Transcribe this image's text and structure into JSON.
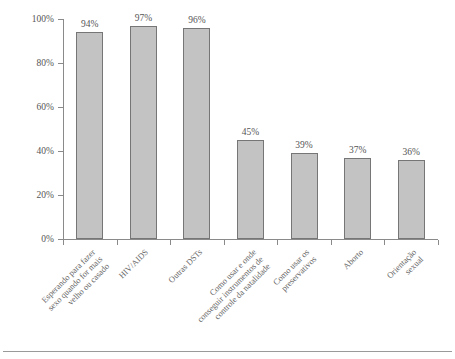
{
  "chart_data": {
    "type": "bar",
    "title": "",
    "subtitle": "",
    "xlabel": "",
    "ylabel": "",
    "ylim": [
      0,
      100
    ],
    "yticks": [
      "0%",
      "20%",
      "40%",
      "60%",
      "80%",
      "100%"
    ],
    "ytick_values": [
      0,
      20,
      40,
      60,
      80,
      100
    ],
    "grid": false,
    "legend": false,
    "legend_position": "none",
    "orientation": "vertical",
    "bar_color": "#c3c3c3",
    "bar_border_color": "#767676",
    "axis_color": "#8a8a8a",
    "text_color": "#555555",
    "value_label_suffix": "%",
    "categories": [
      "Esperando para fazer sexo quando for mais velho ou casado",
      "HIV/AIDS",
      "Outras DSTs",
      "Como usar e onde conseguir instrumentos de controle da natalidade",
      "Como usar os preservativos",
      "Aborto",
      "Orientação sexual"
    ],
    "category_lines": [
      [
        "Esperando para fazer",
        "sexo quando for mais",
        "velho ou casado"
      ],
      [
        "HIV/AIDS"
      ],
      [
        "Outras DSTs"
      ],
      [
        "Como usar e onde",
        "conseguir instrumentos de",
        "controle da natalidade"
      ],
      [
        "Como usar os",
        "preservativos"
      ],
      [
        "Aborto"
      ],
      [
        "Orientação",
        "sexual"
      ]
    ],
    "values": [
      94,
      97,
      96,
      45,
      39,
      37,
      36
    ],
    "value_labels": [
      "94%",
      "97%",
      "96%",
      "45%",
      "39%",
      "37%",
      "36%"
    ]
  }
}
